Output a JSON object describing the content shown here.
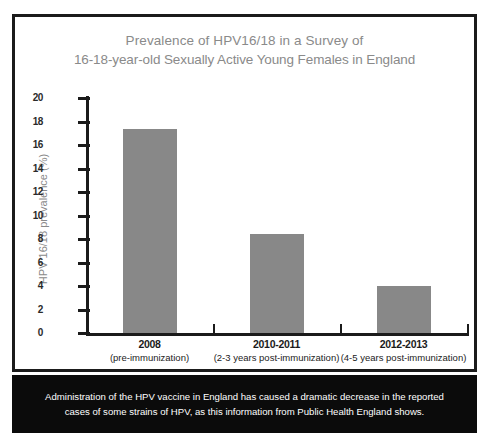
{
  "chart_data": {
    "type": "bar",
    "title": "Prevalence of HPV16/18 in a Survey of 16-18-year-old Sexually Active Young Females in England",
    "title_lines": [
      "Prevalence of HPV16/18 in a Survey of",
      "16-18-year-old Sexually Active Young Females in England"
    ],
    "categories": [
      "2008",
      "2010-2011",
      "2012-2013"
    ],
    "category_sublabels": [
      "(pre-immunization)",
      "(2-3 years post-immunization)",
      "(4-5 years post-immunization)"
    ],
    "values": [
      17.4,
      8.4,
      4.0
    ],
    "xlabel": "",
    "ylabel": "HPV 16/18 prevalence (%)",
    "ylim": [
      0,
      20
    ],
    "ytick_labels": [
      "0",
      "2",
      "4",
      "6",
      "8",
      "10",
      "12",
      "14",
      "16",
      "18",
      "20"
    ],
    "ytick_values": [
      0,
      2,
      4,
      6,
      8,
      10,
      12,
      14,
      16,
      18,
      20
    ],
    "grid": false,
    "legend": null,
    "bar_color": "#888888",
    "title_color": "#8a8a8a",
    "axis_color": "#1b1b1b"
  },
  "caption": {
    "lines": [
      "Administration of the HPV vaccine in England has caused a dramatic decrease in the reported",
      "cases of some strains of HPV, as this information from Public Health England shows."
    ],
    "background": "#0b0b0b",
    "text_color": "#ffffff"
  }
}
